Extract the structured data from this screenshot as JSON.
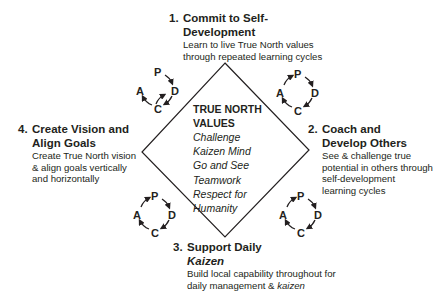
{
  "diagram": {
    "center": {
      "title": "TRUE NORTH VALUES",
      "title_line1": "TRUE NORTH",
      "title_line2": "VALUES",
      "values": [
        "Challenge",
        "Kaizen Mind",
        "Go and See",
        "Teamwork",
        "Respect for",
        "Humanity"
      ]
    },
    "steps": [
      {
        "number": "1.",
        "title_line1": "Commit to Self-",
        "title_line2": "Development",
        "desc_lines": [
          "Learn to live True North values",
          "through repeated learning cycles"
        ]
      },
      {
        "number": "2.",
        "title_line1": "Coach and",
        "title_line2": "Develop Others",
        "desc_lines": [
          "See & challenge true",
          "potential in others through",
          "self-development",
          "learning cycles"
        ]
      },
      {
        "number": "3.",
        "title_line1": "Support Daily",
        "title_line2": "Kaizen",
        "desc_lines": [
          "Build local capability throughout for",
          "daily management & "
        ],
        "desc_italic_tail": "kaizen"
      },
      {
        "number": "4.",
        "title_line1": "Create Vision and",
        "title_line2": "Align Goals",
        "desc_lines": [
          "Create True North vision",
          "& align goals vertically",
          "and horizontally"
        ]
      }
    ],
    "pdca_cycle": {
      "labels": {
        "p": "P",
        "d": "D",
        "c": "C",
        "a": "A"
      },
      "icon": "pdca-cycle-icon"
    }
  }
}
